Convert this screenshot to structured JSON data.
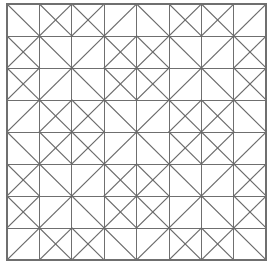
{
  "figure": {
    "kind": "line-art-tiling",
    "width": 273,
    "height": 266,
    "background_color": "#ffffff",
    "line_color": "#6f6f6f",
    "diagonal_color": "#6a6a6a",
    "line_width": 1
  },
  "grid": {
    "columns": 8,
    "rows": 8,
    "origin_x": 7,
    "origin_y": 4,
    "cell_width": 32.4,
    "cell_height": 32.0,
    "total_width": 259.2,
    "total_height": 256.0,
    "x_positions": [
      7,
      39.4,
      71.8,
      104.2,
      136.6,
      169.0,
      201.4,
      233.8,
      266.2
    ],
    "y_positions": [
      4,
      36,
      68,
      100,
      132,
      164,
      196,
      228,
      260
    ],
    "show_border": true,
    "show_grid_lines": true
  },
  "tiles": {
    "legend": {
      "bslash": "diagonal from top-left corner to bottom-right corner",
      "slash": "diagonal from bottom-left corner to top-right corner",
      "both": "both diagonals drawn (X)",
      "none": "no diagonal in this cell"
    },
    "rows": [
      [
        "bslash",
        "slash",
        "bslash",
        "slash",
        "bslash",
        "slash",
        "bslash",
        "slash"
      ],
      [
        "slash",
        "bslash",
        "slash",
        "bslash",
        "slash",
        "bslash",
        "slash",
        "bslash"
      ],
      [
        "bslash",
        "slash",
        "bslash",
        "slash",
        "bslash",
        "slash",
        "bslash",
        "slash"
      ],
      [
        "slash",
        "bslash",
        "slash",
        "bslash",
        "slash",
        "bslash",
        "slash",
        "bslash"
      ],
      [
        "bslash",
        "slash",
        "bslash",
        "slash",
        "bslash",
        "slash",
        "bslash",
        "slash"
      ],
      [
        "slash",
        "bslash",
        "slash",
        "bslash",
        "slash",
        "bslash",
        "slash",
        "bslash"
      ],
      [
        "bslash",
        "slash",
        "bslash",
        "slash",
        "bslash",
        "slash",
        "bslash",
        "slash"
      ],
      [
        "slash",
        "bslash",
        "slash",
        "bslash",
        "slash",
        "bslash",
        "slash",
        "bslash"
      ]
    ]
  },
  "extra_diagonals": {
    "description": "Additional diagonals creating the diamond-in-square motifs",
    "rows": [
      [
        "none",
        "bslash",
        "slash",
        "none",
        "none",
        "bslash",
        "slash",
        "none"
      ],
      [
        "bslash",
        "none",
        "none",
        "slash",
        "bslash",
        "none",
        "none",
        "slash"
      ],
      [
        "slash",
        "none",
        "none",
        "bslash",
        "slash",
        "none",
        "none",
        "bslash"
      ],
      [
        "none",
        "slash",
        "bslash",
        "none",
        "none",
        "slash",
        "bslash",
        "none"
      ],
      [
        "none",
        "bslash",
        "slash",
        "none",
        "none",
        "bslash",
        "slash",
        "none"
      ],
      [
        "bslash",
        "none",
        "none",
        "slash",
        "bslash",
        "none",
        "none",
        "slash"
      ],
      [
        "slash",
        "none",
        "none",
        "bslash",
        "slash",
        "none",
        "none",
        "bslash"
      ],
      [
        "none",
        "slash",
        "bslash",
        "none",
        "none",
        "slash",
        "bslash",
        "none"
      ]
    ]
  },
  "motifs": {
    "count": 4,
    "description": "Four quadrant diamond-in-square blocks plus a central diamond formed at the quadrant junction",
    "block_size_cells": 4
  }
}
